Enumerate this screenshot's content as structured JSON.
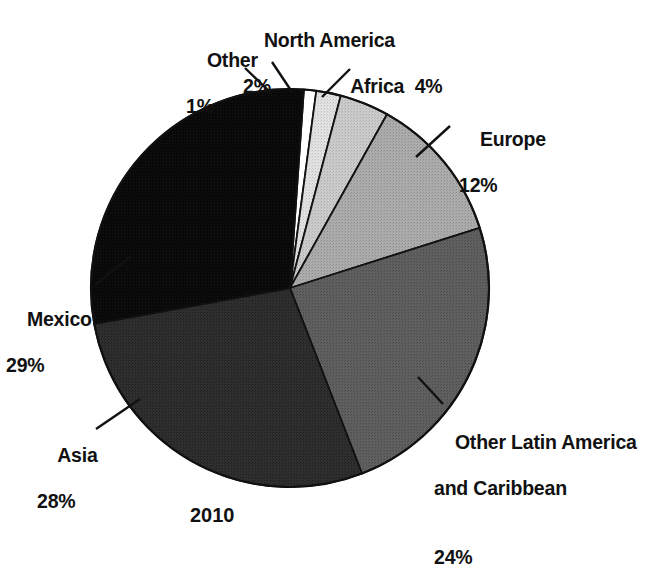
{
  "chart_data": {
    "type": "pie",
    "title": "",
    "caption": "2010",
    "unit": "%",
    "total": 100,
    "start_angle_deg": -86,
    "direction": "clockwise",
    "categories": [
      "Other",
      "North America",
      "Africa",
      "Europe",
      "Other Latin America and Caribbean",
      "Asia",
      "Mexico"
    ],
    "values": [
      1,
      2,
      4,
      12,
      24,
      28,
      29
    ],
    "slices": [
      {
        "label": "Other",
        "value": 1,
        "value_text": "1%",
        "color": "#ffffff"
      },
      {
        "label": "North America",
        "value": 2,
        "value_text": "2%",
        "color": "#dcdcdc"
      },
      {
        "label": "Africa",
        "value": 4,
        "value_text": "4%",
        "color": "#c6c6c6"
      },
      {
        "label": "Europe",
        "value": 12,
        "value_text": "12%",
        "color": "#a6a6a6"
      },
      {
        "label": "Other Latin America and Caribbean",
        "value": 24,
        "value_text": "24%",
        "color": "#5a5a5a"
      },
      {
        "label": "Asia",
        "value": 28,
        "value_text": "28%",
        "color": "#2b2b2b"
      },
      {
        "label": "Mexico",
        "value": 29,
        "value_text": "29%",
        "color": "#0a0a0a"
      }
    ],
    "legend_position": "external-callouts",
    "grid": false,
    "stroke_color": "#111111"
  },
  "labels": {
    "other": {
      "name": "Other",
      "pct": "1%"
    },
    "north_america": {
      "name": "North America",
      "pct": "2%"
    },
    "africa": {
      "name": "Africa  4%"
    },
    "europe": {
      "name": "Europe",
      "pct": "12%"
    },
    "olac": {
      "line1": "Other Latin America",
      "line2": "and Caribbean",
      "pct": "24%"
    },
    "asia": {
      "name": "Asia",
      "pct": "28%"
    },
    "mexico": {
      "name": "Mexico",
      "pct": "29%"
    }
  },
  "caption": {
    "year": "2010"
  }
}
